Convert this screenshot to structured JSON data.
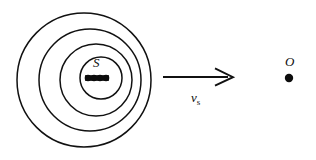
{
  "figure": {
    "stroke_color": "#111111",
    "fill_color": "#0d0d0d",
    "background_color": "#ffffff",
    "labels": {
      "source": "S",
      "observer": "O",
      "velocity": "v",
      "velocity_subscript": "s"
    },
    "wavefronts": [
      {
        "name": "wavefront-1-outermost",
        "cx": 84,
        "cy": 80,
        "r": 67
      },
      {
        "name": "wavefront-2",
        "cx": 90,
        "cy": 80,
        "r": 51
      },
      {
        "name": "wavefront-3",
        "cx": 96,
        "cy": 80,
        "r": 36
      },
      {
        "name": "wavefront-4-innermost",
        "cx": 101,
        "cy": 78,
        "r": 21
      }
    ],
    "source_positions": [
      {
        "name": "source-position-1",
        "cx": 88,
        "cy": 78,
        "r": 3.3
      },
      {
        "name": "source-position-2",
        "cx": 94,
        "cy": 78,
        "r": 3.3
      },
      {
        "name": "source-position-3",
        "cx": 100,
        "cy": 78,
        "r": 3.3
      },
      {
        "name": "source-position-4",
        "cx": 106,
        "cy": 78,
        "r": 3.3
      }
    ],
    "velocity_arrow": {
      "x1": 163,
      "y1": 77,
      "x2": 232,
      "y2": 77
    },
    "observer_point": {
      "cx": 289,
      "cy": 78,
      "r": 4.2
    }
  }
}
